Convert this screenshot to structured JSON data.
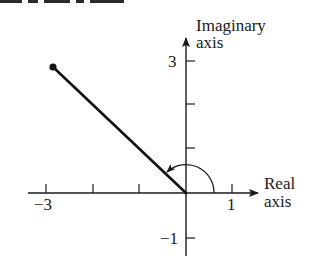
{
  "figure": {
    "type": "complex-plane-phasor",
    "axes": {
      "horizontal": {
        "label_line1": "Real",
        "label_line2": "axis",
        "tick_labels": {
          "left": "−3",
          "right": "1"
        },
        "ticks": [
          -3,
          -2,
          -1,
          1
        ],
        "range": [
          -3.4,
          1.6
        ]
      },
      "vertical": {
        "label_line1": "Imaginary",
        "label_line2": "axis",
        "tick_labels": {
          "top": "3",
          "bottom": "−1"
        },
        "ticks": [
          -1,
          1,
          2,
          3
        ],
        "range": [
          -1.4,
          3.5
        ]
      }
    },
    "phasor": {
      "tip": {
        "re": -2.9,
        "im": 2.95
      },
      "marker": "filled-dot",
      "angle_arc": "counter-clockwise from positive real axis"
    },
    "colors": {
      "ink": "#1a1a1a",
      "background": "#ffffff"
    }
  },
  "clipped_header": {
    "visible": "partially clipped text line at top (illegible)"
  }
}
